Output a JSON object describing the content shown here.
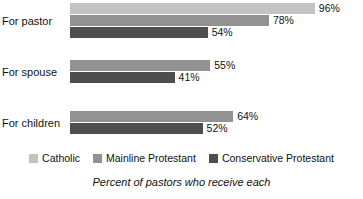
{
  "chart_data": {
    "type": "bar",
    "orientation": "horizontal",
    "title": "",
    "subtitle": "",
    "caption": "Percent of pastors who receive each",
    "xlabel": "",
    "ylabel": "",
    "xlim": [
      0,
      100
    ],
    "grid": false,
    "legend_position": "bottom",
    "value_suffix": "%",
    "categories": [
      "For pastor",
      "For spouse",
      "For children"
    ],
    "series": [
      {
        "name": "Catholic",
        "color": "#c3c3c3",
        "values": [
          96,
          null,
          null
        ]
      },
      {
        "name": "Mainline Protestant",
        "color": "#929292",
        "values": [
          78,
          55,
          64
        ]
      },
      {
        "name": "Conservative Protestant",
        "color": "#4e4e4e",
        "values": [
          54,
          41,
          52
        ]
      }
    ],
    "groups": [
      {
        "label": "For pastor",
        "bars": [
          {
            "series": "Catholic",
            "value": 96,
            "value_label": "96%",
            "color": "#c3c3c3"
          },
          {
            "series": "Mainline Protestant",
            "value": 78,
            "value_label": "78%",
            "color": "#929292"
          },
          {
            "series": "Conservative Protestant",
            "value": 54,
            "value_label": "54%",
            "color": "#4e4e4e"
          }
        ]
      },
      {
        "label": "For spouse",
        "bars": [
          {
            "series": "Mainline Protestant",
            "value": 55,
            "value_label": "55%",
            "color": "#929292"
          },
          {
            "series": "Conservative Protestant",
            "value": 41,
            "value_label": "41%",
            "color": "#4e4e4e"
          }
        ]
      },
      {
        "label": "For children",
        "bars": [
          {
            "series": "Mainline Protestant",
            "value": 64,
            "value_label": "64%",
            "color": "#929292"
          },
          {
            "series": "Conservative Protestant",
            "value": 52,
            "value_label": "52%",
            "color": "#4e4e4e"
          }
        ]
      }
    ],
    "legend": [
      {
        "label": "Catholic",
        "color": "#c3c3c3"
      },
      {
        "label": "Mainline Protestant",
        "color": "#929292"
      },
      {
        "label": "Conservative Protestant",
        "color": "#4e4e4e"
      }
    ]
  },
  "layout": {
    "bar_origin_x": 70,
    "px_per_percent": 2.55,
    "group_tops": [
      3,
      60,
      111
    ],
    "background": "#ffffff",
    "text_color": "#111111"
  }
}
